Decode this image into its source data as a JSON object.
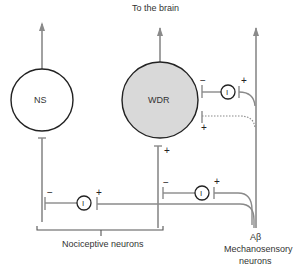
{
  "diagram": {
    "title_top": "To the brain",
    "neurons": {
      "ns": {
        "label": "NS",
        "fill": "#ffffff"
      },
      "wdr": {
        "label": "WDR",
        "fill": "#d9d9d9"
      },
      "interneuron_label": "I"
    },
    "signs": {
      "minus": "−",
      "plus": "+"
    },
    "labels": {
      "nociceptive": "Nociceptive neurons",
      "abeta_line1": "Aβ",
      "abeta_line2": "Mechanosensory",
      "abeta_line3": "neurons"
    },
    "colors": {
      "line": "#8a8a8a",
      "outline": "#222222",
      "wdr_fill": "#d9d9d9"
    }
  }
}
